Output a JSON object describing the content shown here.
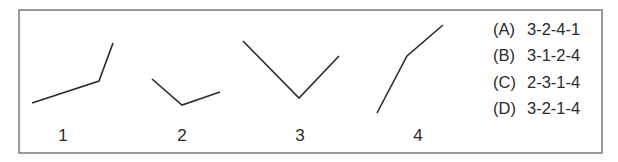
{
  "figure": {
    "frame": {
      "x": 19,
      "y": 10,
      "width": 583,
      "height": 143,
      "stroke": "#7a7a7a"
    },
    "line_color": "#2b2b2b",
    "shapes": [
      {
        "label": "1",
        "points": "32,103 99,81 113,43",
        "label_x": 63,
        "label_y": 127
      },
      {
        "label": "2",
        "points": "152,79 182,105 220,92",
        "label_x": 182,
        "label_y": 127
      },
      {
        "label": "3",
        "points": "243,41 299,98 339,56",
        "label_x": 300,
        "label_y": 127
      },
      {
        "label": "4",
        "points": "377,113 407,56 443,25",
        "label_x": 418,
        "label_y": 127
      }
    ]
  },
  "options": [
    {
      "key": "(A)",
      "value": "3-2-4-1"
    },
    {
      "key": "(B)",
      "value": "3-1-2-4"
    },
    {
      "key": "(C)",
      "value": "2-3-1-4"
    },
    {
      "key": "(D)",
      "value": "3-2-1-4"
    }
  ]
}
